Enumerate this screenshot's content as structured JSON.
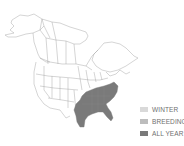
{
  "map": {
    "region": "North America",
    "range_fill_color": "#7a7a7a",
    "outline_color": "#9a9a9a"
  },
  "legend": {
    "items": [
      {
        "label": "WINTER",
        "color": "#d9d9d9"
      },
      {
        "label": "BREEDING",
        "color": "#bdbdbd"
      },
      {
        "label": "ALL YEAR",
        "color": "#7a7a7a"
      }
    ]
  }
}
